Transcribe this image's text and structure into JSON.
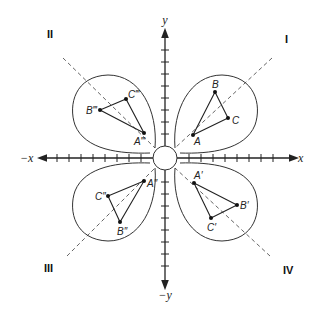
{
  "diagram": {
    "axes": {
      "x_pos_label": "x",
      "x_neg_label": "−x",
      "y_pos_label": "y",
      "y_neg_label": "−y"
    },
    "quadrants": {
      "q1": "I",
      "q2": "II",
      "q3": "III",
      "q4": "IV"
    },
    "triangles": {
      "q1": {
        "a": "A",
        "b": "B",
        "c": "C"
      },
      "q2": {
        "a": "A‴",
        "b": "B‴",
        "c": "C‴"
      },
      "q3": {
        "a": "A″",
        "b": "B″",
        "c": "C″"
      },
      "q4": {
        "a": "A′",
        "b": "B′",
        "c": "C′"
      }
    },
    "colors": {
      "line": "#333333",
      "background": "#ffffff"
    }
  }
}
